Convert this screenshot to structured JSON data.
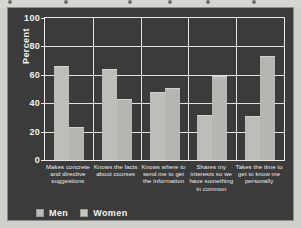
{
  "figure": {
    "background_color": "#3b3b3b",
    "bar_color_men": "#bdbdb9",
    "bar_color_women": "#b6b6b2",
    "grid_color": "#e2e2de",
    "text_color": "#f2f2ee"
  },
  "legend": {
    "items": [
      {
        "label": "Men",
        "key": "men"
      },
      {
        "label": "Women",
        "key": "women"
      }
    ]
  },
  "axis": {
    "ylabel": "Percent",
    "yticks": [
      "0",
      "20",
      "40",
      "60",
      "80",
      "100"
    ]
  },
  "chart_data": {
    "type": "bar",
    "title": "",
    "xlabel": "",
    "ylabel": "Percent",
    "ylim": [
      0,
      100
    ],
    "yticks": [
      0,
      20,
      40,
      60,
      80,
      100
    ],
    "grid": true,
    "legend_position": "bottom-left",
    "categories": [
      "Makes concrete and directive suggestions",
      "Knows the facts about courses",
      "Knows where to send me to get the information",
      "Shares my interests so we have something in common",
      "Takes the time to get to know me personally"
    ],
    "series": [
      {
        "name": "Men",
        "values": [
          66,
          64,
          48,
          32,
          31
        ]
      },
      {
        "name": "Women",
        "values": [
          23,
          43,
          51,
          59,
          73
        ]
      }
    ]
  }
}
